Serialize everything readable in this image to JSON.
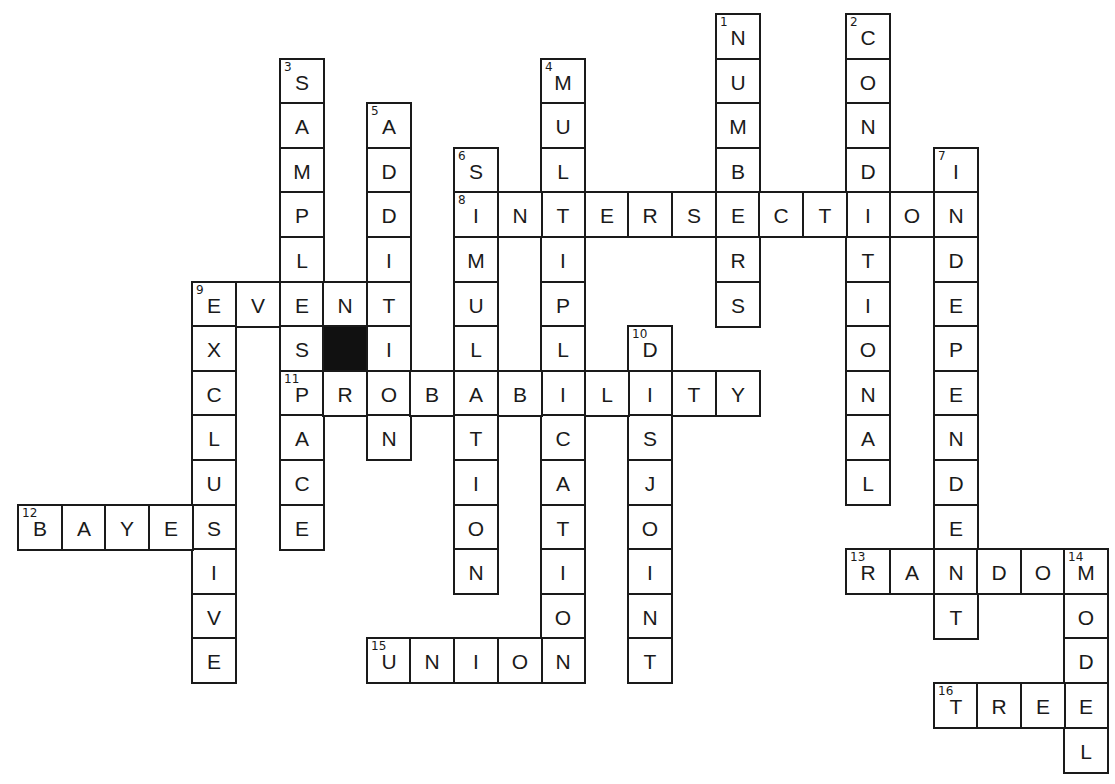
{
  "puzzle": {
    "type": "crossword",
    "grid": {
      "origin_x": 17,
      "origin_y": 13,
      "cell_w": 43.6,
      "cell_h": 44.6,
      "cols": 25,
      "rows": 17
    },
    "colors": {
      "border": "#1a1a1a",
      "fill": "#ffffff",
      "block": "#111111",
      "text": "#1a1a1a"
    },
    "entries": [
      {
        "number": 1,
        "direction": "down",
        "answer": "NUMBERS",
        "row": 0,
        "col": 16
      },
      {
        "number": 2,
        "direction": "down",
        "answer": "CONDITIONAL",
        "row": 0,
        "col": 19
      },
      {
        "number": 3,
        "direction": "down",
        "answer": "SAMPLESPACE",
        "row": 1,
        "col": 6
      },
      {
        "number": 4,
        "direction": "down",
        "answer": "MULTIPLICATION",
        "row": 1,
        "col": 12
      },
      {
        "number": 5,
        "direction": "down",
        "answer": "ADDITION",
        "row": 2,
        "col": 8
      },
      {
        "number": 6,
        "direction": "down",
        "answer": "SIMULATION",
        "row": 3,
        "col": 10
      },
      {
        "number": 7,
        "direction": "down",
        "answer": "INDEPENDENT",
        "row": 3,
        "col": 21
      },
      {
        "number": 8,
        "direction": "across",
        "answer": "INTERSECTION",
        "row": 4,
        "col": 10
      },
      {
        "number": 9,
        "direction": "across",
        "answer": "EVENT",
        "row": 6,
        "col": 4
      },
      {
        "number": 9,
        "direction": "down",
        "answer": "EXCLUSIVE",
        "row": 6,
        "col": 4
      },
      {
        "number": 10,
        "direction": "down",
        "answer": "DISJOINT",
        "row": 7,
        "col": 14
      },
      {
        "number": 11,
        "direction": "across",
        "answer": "PROBABILITY",
        "row": 8,
        "col": 6
      },
      {
        "number": 12,
        "direction": "across",
        "answer": "BAYES",
        "row": 11,
        "col": 0
      },
      {
        "number": 13,
        "direction": "across",
        "answer": "RANDOM",
        "row": 12,
        "col": 19
      },
      {
        "number": 14,
        "direction": "down",
        "answer": "MODEL",
        "row": 12,
        "col": 24
      },
      {
        "number": 15,
        "direction": "across",
        "answer": "UNION",
        "row": 14,
        "col": 8
      },
      {
        "number": 16,
        "direction": "across",
        "answer": "TREE",
        "row": 15,
        "col": 21
      }
    ],
    "black_cells": [
      {
        "row": 7,
        "col": 7
      }
    ]
  }
}
